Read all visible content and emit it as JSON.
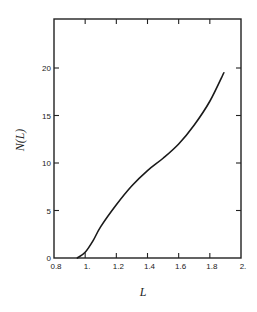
{
  "chart_data": {
    "type": "line",
    "title": "",
    "xlabel": "L",
    "ylabel": "N(L)",
    "xlim": [
      0.8,
      2.0
    ],
    "ylim": [
      0,
      25
    ],
    "grid": false,
    "legend": null,
    "x_ticks": [
      0.8,
      1.0,
      1.2,
      1.4,
      1.6,
      1.8,
      2.0
    ],
    "x_tick_labels": [
      "0.8",
      "1.",
      "1.2",
      "1.4",
      "1.6",
      "1.8",
      "2."
    ],
    "y_ticks": [
      0,
      5,
      10,
      15,
      20
    ],
    "y_tick_labels": [
      "0",
      "5",
      "10",
      "15",
      "20"
    ],
    "series": [
      {
        "name": "N(L)",
        "x": [
          0.95,
          1.0,
          1.05,
          1.1,
          1.2,
          1.3,
          1.4,
          1.5,
          1.6,
          1.7,
          1.8,
          1.89
        ],
        "y": [
          0,
          0.6,
          1.8,
          3.3,
          5.6,
          7.6,
          9.2,
          10.5,
          12.0,
          14.0,
          16.5,
          19.5
        ]
      }
    ]
  }
}
